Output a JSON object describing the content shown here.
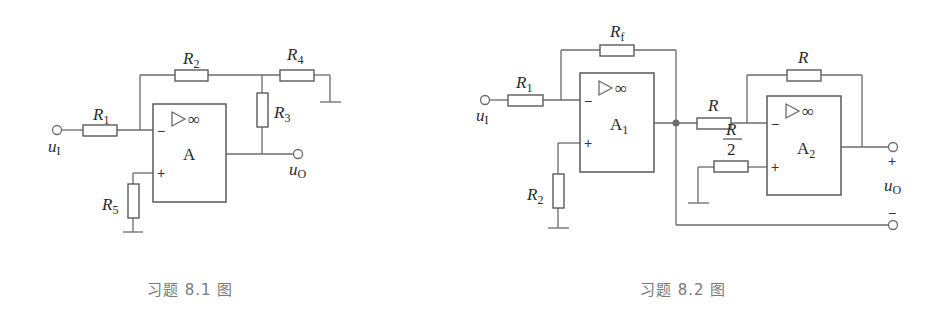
{
  "figures": [
    {
      "id": "fig-8-1",
      "caption": "习题 8.1 图",
      "opamp_label": "A",
      "opamp_symbol": "▷∞",
      "input_label": "u",
      "input_sub": "I",
      "output_label": "u",
      "output_sub": "O",
      "resistors": [
        {
          "name": "R",
          "sub": "1"
        },
        {
          "name": "R",
          "sub": "2"
        },
        {
          "name": "R",
          "sub": "3"
        },
        {
          "name": "R",
          "sub": "4"
        },
        {
          "name": "R",
          "sub": "5"
        }
      ],
      "inverting_sign": "−",
      "noninverting_sign": "+"
    },
    {
      "id": "fig-8-2",
      "caption": "习题 8.2 图",
      "opamps": [
        {
          "label": "A",
          "sub": "1",
          "symbol": "▷∞"
        },
        {
          "label": "A",
          "sub": "2",
          "symbol": "▷∞"
        }
      ],
      "input_label": "u",
      "input_sub": "I",
      "output_label": "u",
      "output_sub": "O",
      "output_plus": "+",
      "output_minus": "−",
      "resistors": [
        {
          "name": "R",
          "sub": "1"
        },
        {
          "name": "R",
          "sub": "f"
        },
        {
          "name": "R",
          "sub": "2"
        },
        {
          "name": "R",
          "sub": ""
        },
        {
          "name": "R",
          "sub": ""
        },
        {
          "name": "R",
          "denominator": "2"
        }
      ],
      "inverting_sign": "−",
      "noninverting_sign": "+"
    }
  ]
}
